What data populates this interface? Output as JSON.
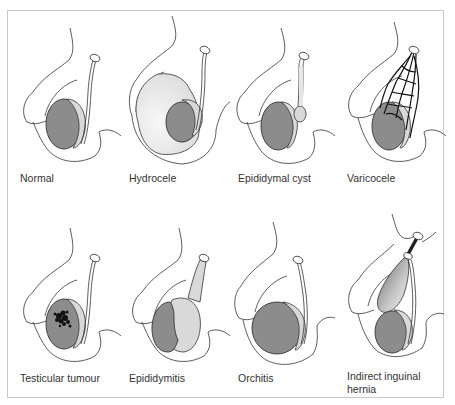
{
  "figure": {
    "type": "anatomical-illustration",
    "colors": {
      "outline": "#333333",
      "testis": "#8c8c8c",
      "epididymis": "#d9d9d9",
      "fluid": "#e6e6e6",
      "frame": "#c9c9c9"
    },
    "panels": [
      {
        "id": "normal",
        "label": "Normal"
      },
      {
        "id": "hydrocele",
        "label": "Hydrocele"
      },
      {
        "id": "epididymal-cyst",
        "label": "Epididymal cyst"
      },
      {
        "id": "varicocele",
        "label": "Varicocele"
      },
      {
        "id": "testicular-tumour",
        "label": "Testicular tumour"
      },
      {
        "id": "epididymitis",
        "label": "Epididymitis"
      },
      {
        "id": "orchitis",
        "label": "Orchitis"
      },
      {
        "id": "indirect-inguinal-hernia",
        "label": "Indirect inguinal hernia",
        "label_line1": "Indirect inguinal",
        "label_line2": "hernia"
      }
    ]
  }
}
